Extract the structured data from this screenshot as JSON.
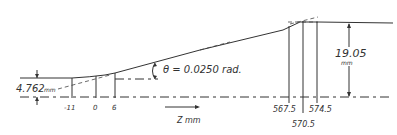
{
  "diagram": {
    "angle_label": "θ = 0.0250 rad.",
    "axis_label": "Z  mm",
    "inlet_radius_label": "4.762",
    "inlet_radius_unit": "mm",
    "outlet_height_label": "19.05",
    "outlet_height_unit": "mm",
    "z_markers": [
      {
        "label": "-11",
        "x": 72
      },
      {
        "label": "0",
        "x": 96
      },
      {
        "label": "6",
        "x": 115
      },
      {
        "label": "567.5",
        "x": 289
      },
      {
        "label": "570.5",
        "x": 303
      },
      {
        "label": "574.5",
        "x": 317
      }
    ]
  }
}
